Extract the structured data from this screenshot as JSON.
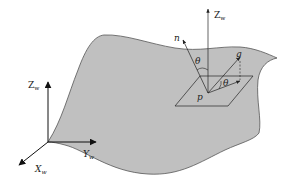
{
  "diagram": {
    "type": "surface-normal-gravity-geometry",
    "colors": {
      "surface_fill": "#c0c0c0",
      "surface_stroke": "#555555",
      "line": "#222222",
      "background": "#ffffff"
    },
    "labels": {
      "world_z_global": "Z",
      "world_z_global_sub": "w",
      "world_z_local": "Z",
      "world_z_local_sub": "w",
      "world_y": "Y",
      "world_y_sub": "w",
      "world_x": "X",
      "world_x_sub": "w",
      "normal": "n",
      "gravity": "g",
      "point": "p",
      "angle_normal": "θ",
      "angle_plane": "θ"
    }
  }
}
